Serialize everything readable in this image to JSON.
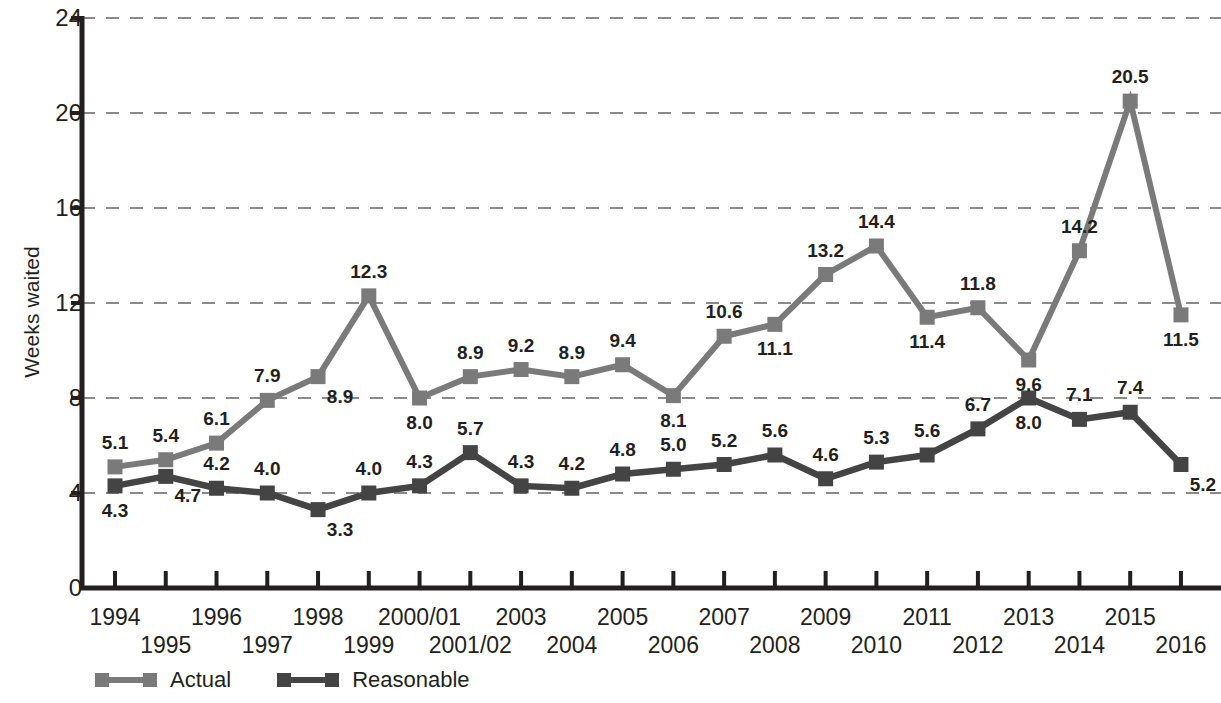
{
  "chart_data": {
    "type": "line",
    "title": "",
    "xlabel": "",
    "ylabel": "Weeks waited",
    "ylim": [
      0,
      24
    ],
    "yticks": [
      0,
      4,
      8,
      12,
      16,
      20,
      24
    ],
    "grid": "horizontal-dashed",
    "legend_position": "bottom-left",
    "categories": [
      "1994",
      "1995",
      "1996",
      "1997",
      "1998",
      "1999",
      "2000/01",
      "2001/02",
      "2003",
      "2004",
      "2005",
      "2006",
      "2007",
      "2008",
      "2009",
      "2010",
      "2011",
      "2012",
      "2013",
      "2014",
      "2015",
      "2016"
    ],
    "series": [
      {
        "name": "Actual",
        "color": "#7a7a7a",
        "values": [
          5.1,
          5.4,
          6.1,
          7.9,
          8.9,
          12.3,
          8.0,
          8.9,
          9.2,
          8.9,
          9.4,
          8.1,
          10.6,
          11.1,
          13.2,
          14.4,
          11.4,
          11.8,
          9.6,
          14.2,
          20.5,
          11.5
        ],
        "labels": [
          "5.1",
          "5.4",
          "6.1",
          "7.9",
          "8.9",
          "12.3",
          "8.0",
          "8.9",
          "9.2",
          "8.9",
          "9.4",
          "8.1",
          "10.6",
          "11.1",
          "13.2",
          "14.4",
          "11.4",
          "11.8",
          "9.6",
          "14.2",
          "20.5",
          "11.5"
        ],
        "label_pos": [
          "above",
          "above",
          "above",
          "above",
          "below-right",
          "above",
          "below",
          "above",
          "above",
          "above",
          "above",
          "below",
          "above",
          "below",
          "above",
          "above",
          "below",
          "above",
          "below",
          "above",
          "above",
          "below"
        ]
      },
      {
        "name": "Reasonable",
        "color": "#444444",
        "values": [
          4.3,
          4.7,
          4.2,
          4.0,
          3.3,
          4.0,
          4.3,
          5.7,
          4.3,
          4.2,
          4.8,
          5.0,
          5.2,
          5.6,
          4.6,
          5.3,
          5.6,
          6.7,
          8.0,
          7.1,
          7.4,
          5.2
        ],
        "labels": [
          "4.3",
          "4.7",
          "4.2",
          "4.0",
          "3.3",
          "4.0",
          "4.3",
          "5.7",
          "4.3",
          "4.2",
          "4.8",
          "5.0",
          "5.2",
          "5.6",
          "4.6",
          "5.3",
          "5.6",
          "6.7",
          "8.0",
          "7.1",
          "7.4",
          "5.2"
        ],
        "label_pos": [
          "below",
          "below-right",
          "above",
          "above",
          "below-right",
          "above",
          "above",
          "above",
          "above",
          "above",
          "above",
          "above",
          "above",
          "above",
          "above",
          "above",
          "above",
          "above",
          "below",
          "above",
          "above",
          "below-right"
        ]
      }
    ]
  },
  "axis": {
    "y_title": "Weeks waited",
    "y_tick_labels": [
      "0",
      "4",
      "8",
      "12",
      "16",
      "20",
      "24"
    ],
    "x_tick_labels_row1": [
      "1994",
      "1996",
      "1998",
      "2000/01",
      "2003",
      "2005",
      "2007",
      "2009",
      "2011",
      "2013",
      "2015"
    ],
    "x_tick_labels_row2": [
      "1995",
      "1997",
      "1999",
      "2001/02",
      "2004",
      "2006",
      "2008",
      "2010",
      "2012",
      "2014",
      "2016"
    ]
  },
  "legend": {
    "items": [
      {
        "label": "Actual",
        "color": "#7a7a7a"
      },
      {
        "label": "Reasonable",
        "color": "#444444"
      }
    ]
  },
  "colors": {
    "actual": "#7a7a7a",
    "reasonable": "#444444",
    "axis": "#231f20",
    "grid": "#8a8a8a",
    "background": "#ffffff"
  }
}
